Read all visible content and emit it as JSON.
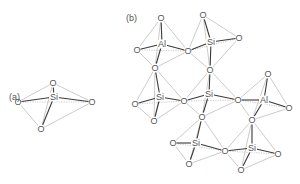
{
  "panels": [
    {
      "id": "a",
      "label": "(a)",
      "label_pos": [
        9,
        100
      ],
      "tetrahedra": [
        {
          "center": {
            "symbol": "Si",
            "x": 54,
            "y": 97
          },
          "oxygens": [
            {
              "symbol": "O",
              "x": 53,
              "y": 83
            },
            {
              "symbol": "O",
              "x": 18,
              "y": 102
            },
            {
              "symbol": "O",
              "x": 92,
              "y": 102
            },
            {
              "symbol": "O",
              "x": 41,
              "y": 129
            }
          ]
        }
      ]
    },
    {
      "id": "b",
      "label": "(b)",
      "label_pos": [
        126,
        21
      ],
      "tetrahedra": [
        {
          "center": {
            "symbol": "Al",
            "x": 162,
            "y": 44
          },
          "oxygens": [
            {
              "symbol": "O",
              "x": 161,
              "y": 18
            },
            {
              "symbol": "O",
              "x": 137,
              "y": 50
            },
            {
              "symbol": "O",
              "x": 188,
              "y": 51
            },
            {
              "symbol": "O",
              "x": 155,
              "y": 68
            }
          ]
        },
        {
          "center": {
            "symbol": "Si",
            "x": 211,
            "y": 42
          },
          "oxygens": [
            {
              "symbol": "O",
              "x": 203,
              "y": 15
            },
            {
              "symbol": "O",
              "x": 188,
              "y": 51
            },
            {
              "symbol": "O",
              "x": 239,
              "y": 38
            },
            {
              "symbol": "O",
              "x": 210,
              "y": 70
            }
          ]
        },
        {
          "center": {
            "symbol": "Si",
            "x": 160,
            "y": 97
          },
          "oxygens": [
            {
              "symbol": "O",
              "x": 155,
              "y": 68
            },
            {
              "symbol": "O",
              "x": 135,
              "y": 104
            },
            {
              "symbol": "O",
              "x": 184,
              "y": 101
            },
            {
              "symbol": "O",
              "x": 154,
              "y": 121
            }
          ]
        },
        {
          "center": {
            "symbol": "Si",
            "x": 209,
            "y": 94
          },
          "oxygens": [
            {
              "symbol": "O",
              "x": 210,
              "y": 70
            },
            {
              "symbol": "O",
              "x": 184,
              "y": 101
            },
            {
              "symbol": "O",
              "x": 238,
              "y": 100
            },
            {
              "symbol": "O",
              "x": 202,
              "y": 117
            }
          ]
        },
        {
          "center": {
            "symbol": "Al",
            "x": 264,
            "y": 100
          },
          "oxygens": [
            {
              "symbol": "O",
              "x": 268,
              "y": 74
            },
            {
              "symbol": "O",
              "x": 238,
              "y": 100
            },
            {
              "symbol": "O",
              "x": 289,
              "y": 108
            },
            {
              "symbol": "O",
              "x": 252,
              "y": 120
            }
          ]
        },
        {
          "center": {
            "symbol": "Si",
            "x": 196,
            "y": 143
          },
          "oxygens": [
            {
              "symbol": "O",
              "x": 202,
              "y": 117
            },
            {
              "symbol": "O",
              "x": 173,
              "y": 143
            },
            {
              "symbol": "O",
              "x": 225,
              "y": 151
            },
            {
              "symbol": "O",
              "x": 189,
              "y": 164
            }
          ]
        },
        {
          "center": {
            "symbol": "Si",
            "x": 252,
            "y": 148
          },
          "oxygens": [
            {
              "symbol": "O",
              "x": 252,
              "y": 120
            },
            {
              "symbol": "O",
              "x": 225,
              "y": 151
            },
            {
              "symbol": "O",
              "x": 278,
              "y": 154
            },
            {
              "symbol": "O",
              "x": 241,
              "y": 170
            }
          ]
        }
      ]
    }
  ],
  "colors": {
    "bond": "#3a3a3a",
    "edge": "#a8a8a8",
    "label": "#555555"
  }
}
